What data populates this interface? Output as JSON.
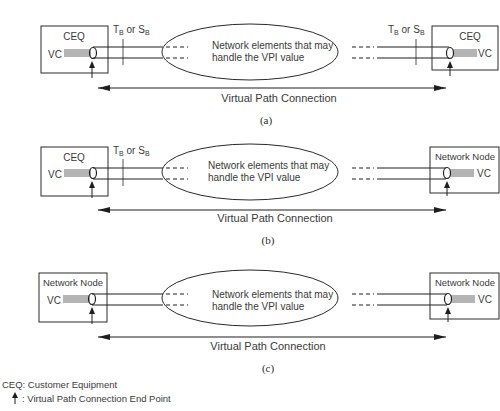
{
  "panels": [
    {
      "id": "a",
      "caption": "(a)",
      "left_node": {
        "label": "CEQ",
        "vc_label": "VC",
        "show_interface": true,
        "interface_label_main": "T",
        "interface_label_sub": "B",
        "interface_or": " or ",
        "interface_label_main2": "S",
        "interface_label_sub2": "B"
      },
      "right_node": {
        "label": "CEQ",
        "vc_label": "VC",
        "show_interface": true,
        "interface_label_main": "T",
        "interface_label_sub": "B",
        "interface_or": " or ",
        "interface_label_main2": "S",
        "interface_label_sub2": "B"
      },
      "cloud_text_line1": "Network elements that may",
      "cloud_text_line2": "handle the VPI value",
      "connection_label": "Virtual Path Connection"
    },
    {
      "id": "b",
      "caption": "(b)",
      "left_node": {
        "label": "CEQ",
        "vc_label": "VC",
        "show_interface": true,
        "interface_label_main": "T",
        "interface_label_sub": "B",
        "interface_or": " or ",
        "interface_label_main2": "S",
        "interface_label_sub2": "B"
      },
      "right_node": {
        "label": "Network Node",
        "vc_label": "VC",
        "show_interface": false
      },
      "cloud_text_line1": "Network elements that may",
      "cloud_text_line2": "handle the VPI value",
      "connection_label": "Virtual Path Connection"
    },
    {
      "id": "c",
      "caption": "(c)",
      "left_node": {
        "label": "Network Node",
        "vc_label": "VC",
        "show_interface": false
      },
      "right_node": {
        "label": "Network Node",
        "vc_label": "VC",
        "show_interface": false
      },
      "cloud_text_line1": "Network elements that may",
      "cloud_text_line2": "handle the VPI value",
      "connection_label": "Virtual Path Connection"
    }
  ],
  "legend": {
    "ceq_definition": "CEQ: Customer Equipment",
    "endpoint_definition": ": Virtual Path Connection End Point",
    "endpoint_icon": "up-arrow-icon"
  },
  "colors": {
    "line": "#1e1e1e",
    "text": "#3a3a3a",
    "background": "#ffffff"
  }
}
